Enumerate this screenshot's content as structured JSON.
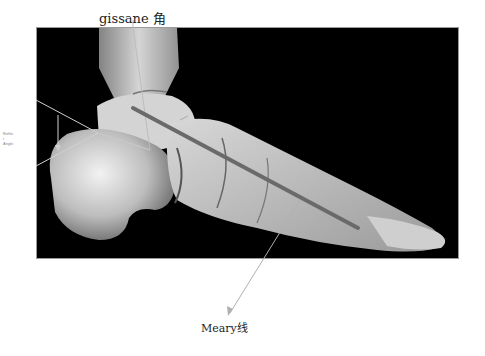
{
  "figure": {
    "type": "lateral foot radiograph with angle annotations",
    "colors": {
      "background": "#ffffff",
      "xray_background": "#000000",
      "bone_light": "#e8e8e8",
      "annotation_line": "#c8c8c8",
      "meary_bar": "#6a6a6a",
      "label_text": "#222222"
    }
  },
  "labels": {
    "gissane": "gissane 角",
    "meary": "Meary线",
    "bohler_line1": "Bohle",
    "bohler_line2": "r",
    "bohler_line3": "Angle"
  }
}
